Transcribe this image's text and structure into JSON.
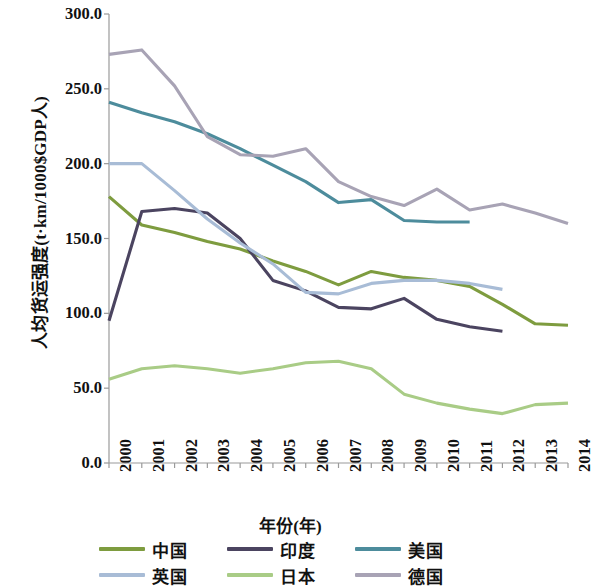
{
  "chart_data": {
    "type": "line",
    "title": "",
    "xlabel": "年份(年)",
    "ylabel": "人均货运强度(t·km/1000$GDP人)",
    "x": [
      2000,
      2001,
      2002,
      2003,
      2004,
      2005,
      2006,
      2007,
      2008,
      2009,
      2010,
      2011,
      2012,
      2013,
      2014
    ],
    "xtick_labels": [
      "2000",
      "2001",
      "2002",
      "2003",
      "2004",
      "2005",
      "2006",
      "2007",
      "2008",
      "2009",
      "2010",
      "2011",
      "2012",
      "2013",
      "2014"
    ],
    "ytick_labels": [
      "0.0",
      "50.0",
      "100.0",
      "150.0",
      "200.0",
      "250.0",
      "300.0"
    ],
    "ytick_values": [
      0,
      50,
      100,
      150,
      200,
      250,
      300
    ],
    "ylim": [
      0,
      300
    ],
    "xlim": [
      2000,
      2014
    ],
    "grid": false,
    "legend_position": "bottom",
    "series": [
      {
        "name": "中国",
        "color": "#7e9c3f",
        "values": [
          178,
          159,
          154,
          148,
          143,
          135,
          128,
          119,
          128,
          124,
          122,
          118,
          106,
          93,
          92
        ]
      },
      {
        "name": "印度",
        "color": "#4b4460",
        "values": [
          95,
          168,
          170,
          167,
          150,
          122,
          115,
          104,
          103,
          110,
          96,
          91,
          88,
          null,
          null
        ]
      },
      {
        "name": "美国",
        "color": "#4d8c9c",
        "values": [
          241,
          234,
          228,
          220,
          210,
          199,
          188,
          174,
          176,
          162,
          161,
          161,
          null,
          null,
          null
        ]
      },
      {
        "name": "英国",
        "color": "#a8bcd6",
        "values": [
          200,
          200,
          182,
          163,
          147,
          133,
          114,
          113,
          120,
          122,
          122,
          120,
          116,
          null,
          null
        ]
      },
      {
        "name": "日本",
        "color": "#a9cc86",
        "values": [
          56,
          63,
          65,
          63,
          60,
          63,
          67,
          68,
          63,
          46,
          40,
          36,
          33,
          39,
          40
        ]
      },
      {
        "name": "德国",
        "color": "#a8a3b5",
        "values": [
          273,
          276,
          252,
          218,
          206,
          205,
          210,
          188,
          178,
          172,
          183,
          169,
          173,
          167,
          160
        ]
      }
    ]
  },
  "axes": {
    "x_axis_name": "year-axis",
    "y_axis_name": "freight-intensity-axis"
  }
}
